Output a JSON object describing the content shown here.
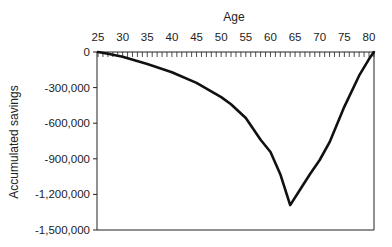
{
  "chart_data": {
    "type": "line",
    "title": "",
    "xlabel": "Age",
    "ylabel": "Accumulated savings",
    "x_ticks": [
      "25",
      "30",
      "35",
      "40",
      "45",
      "50",
      "55",
      "60",
      "65",
      "70",
      "75",
      "80"
    ],
    "y_ticks": [
      "0",
      "-300,000",
      "-600,000",
      "-900,000",
      "-1,200,000",
      "-1,500,000"
    ],
    "xlim": [
      25,
      81
    ],
    "ylim": [
      -1500000,
      0
    ],
    "grid": false,
    "legend": null,
    "x_axis_position": "top",
    "series": [
      {
        "name": "Accumulated savings",
        "x": [
          25,
          27,
          30,
          35,
          40,
          45,
          50,
          52,
          55,
          58,
          60,
          62,
          64,
          66,
          68,
          70,
          72,
          75,
          78,
          80,
          81
        ],
        "values": [
          0,
          -15000,
          -40000,
          -100000,
          -170000,
          -260000,
          -380000,
          -440000,
          -556000,
          -740000,
          -843000,
          -1030000,
          -1290000,
          -1160000,
          -1030000,
          -910000,
          -760000,
          -460000,
          -200000,
          -60000,
          0
        ]
      }
    ]
  }
}
